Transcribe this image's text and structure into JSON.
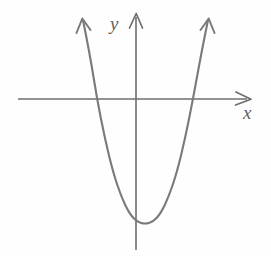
{
  "figure": {
    "kind": "math-graph",
    "background_color": "#fefefe",
    "width": 271,
    "height": 256,
    "axis_color": "#6e6e6e",
    "curve_color": "#7a7a7a",
    "labels": {
      "y_axis": "y",
      "x_axis": "x"
    }
  },
  "chart_data": {
    "type": "line",
    "title": "",
    "subtitle": "",
    "xlabel": "x",
    "ylabel": "y",
    "grid": false,
    "legend": null,
    "annotations": [],
    "curve_name": "upward-opening parabola",
    "equation_form": "y = a(x - h)^2 + k, a > 0",
    "features": {
      "vertex": {
        "x_px": 145,
        "y_px": 224
      },
      "x_intercepts_px": [
        97,
        193
      ],
      "axis_of_symmetry_px": 145,
      "opens": "up",
      "arrowheads": [
        "left-branch-top",
        "right-branch-top"
      ]
    },
    "axes": {
      "origin_px": {
        "x": 136,
        "y": 99
      },
      "x_axis_px": {
        "start": 18,
        "end": 250,
        "y": 99,
        "arrow_at": "end"
      },
      "y_axis_px": {
        "x": 136,
        "top": 14,
        "bottom": 250,
        "arrow_at": "top"
      },
      "xlim_px": [
        18,
        250
      ],
      "ylim_px": [
        14,
        250
      ],
      "tick_labels_x": [],
      "tick_labels_y": []
    },
    "x": [
      83,
      90,
      97,
      105,
      113,
      121,
      129,
      137,
      145,
      153,
      161,
      169,
      177,
      185,
      193,
      201,
      208
    ],
    "y": [
      20,
      55,
      99,
      139,
      172,
      196,
      213,
      222,
      224,
      222,
      213,
      196,
      172,
      139,
      99,
      55,
      20
    ]
  }
}
